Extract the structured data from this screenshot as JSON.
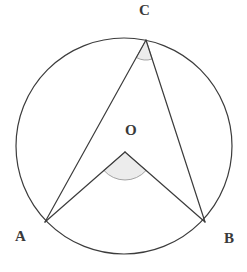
{
  "figure": {
    "background_color": "#ffffff",
    "stroke_color": "#3c3c3c",
    "angle_fill_color": "#ececec",
    "angle_stroke_color": "#9a9a9a",
    "label_color": "#3a3a3a"
  },
  "labels": {
    "a": "A",
    "b": "B",
    "c": "C",
    "o": "O"
  },
  "chart_data": {
    "type": "scatter",
    "xlabel": "",
    "ylabel": "",
    "circle": {
      "center_x": 124,
      "center_y": 146,
      "radius": 108,
      "stroke_width": 1.2
    },
    "points": [
      {
        "name": "A",
        "x": 45,
        "y": 222,
        "label": "A",
        "label_x": 21,
        "label_y": 242,
        "on_circle": true
      },
      {
        "name": "B",
        "x": 205,
        "y": 222,
        "label": "B",
        "label_x": 230,
        "label_y": 244,
        "on_circle": true
      },
      {
        "name": "C",
        "x": 146,
        "y": 40,
        "label": "C",
        "label_x": 145,
        "label_y": 16,
        "on_circle": true
      },
      {
        "name": "O",
        "x": 125,
        "y": 152,
        "label": "O",
        "label_x": 131,
        "label_y": 136,
        "on_circle": false
      }
    ],
    "segments": [
      {
        "name": "AC",
        "from": "A",
        "to": "C"
      },
      {
        "name": "BC",
        "from": "B",
        "to": "C"
      },
      {
        "name": "AO",
        "from": "A",
        "to": "O"
      },
      {
        "name": "BO",
        "from": "B",
        "to": "O"
      }
    ],
    "angle_markers": [
      {
        "name": "inscribed-angle-ACB",
        "vertex": "C",
        "vertex_x": 146,
        "vertex_y": 40,
        "radius": 20,
        "arms": [
          "A",
          "B"
        ],
        "fill": "#ececec",
        "stroke": "#9a9a9a"
      },
      {
        "name": "central-angle-AOB",
        "vertex": "O",
        "vertex_x": 125,
        "vertex_y": 152,
        "radius": 28,
        "arms": [
          "A",
          "B"
        ],
        "fill": "#ececec",
        "stroke": "#9a9a9a"
      }
    ],
    "grid": false,
    "legend": null
  }
}
